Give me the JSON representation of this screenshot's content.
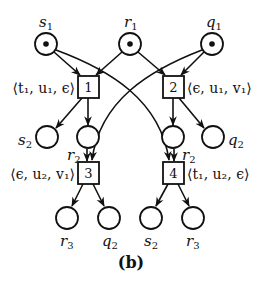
{
  "figure": {
    "caption": "(b)",
    "colors": {
      "stroke": "#111111",
      "background": "#ffffff",
      "token": "#111111"
    }
  },
  "places": [
    {
      "id": "s1",
      "label": "s",
      "sub": "1",
      "x": 46,
      "y": 44,
      "token": true,
      "label_pos": "above"
    },
    {
      "id": "r1",
      "label": "r",
      "sub": "1",
      "x": 130,
      "y": 44,
      "token": true,
      "label_pos": "above"
    },
    {
      "id": "q1",
      "label": "q",
      "sub": "1",
      "x": 212,
      "y": 44,
      "token": true,
      "label_pos": "above"
    },
    {
      "id": "s2a",
      "label": "s",
      "sub": "2",
      "x": 47,
      "y": 137,
      "token": false,
      "label_pos": "left"
    },
    {
      "id": "r2a",
      "label": "r",
      "sub": "2",
      "x": 88,
      "y": 137,
      "token": false,
      "label_pos": "below-left"
    },
    {
      "id": "r2b",
      "label": "r",
      "sub": "2",
      "x": 173,
      "y": 137,
      "token": false,
      "label_pos": "below-right"
    },
    {
      "id": "q2a",
      "label": "q",
      "sub": "2",
      "x": 213,
      "y": 137,
      "token": false,
      "label_pos": "right"
    },
    {
      "id": "r3a",
      "label": "r",
      "sub": "3",
      "x": 67,
      "y": 218,
      "token": false,
      "label_pos": "below"
    },
    {
      "id": "q2b",
      "label": "q",
      "sub": "2",
      "x": 109,
      "y": 218,
      "token": false,
      "label_pos": "below"
    },
    {
      "id": "s2b",
      "label": "s",
      "sub": "2",
      "x": 151,
      "y": 218,
      "token": false,
      "label_pos": "below"
    },
    {
      "id": "r3b",
      "label": "r",
      "sub": "3",
      "x": 193,
      "y": 218,
      "token": false,
      "label_pos": "below"
    }
  ],
  "transitions": [
    {
      "id": "t1",
      "number": "1",
      "x": 88,
      "y": 87,
      "label": "⟨t₁, u₁, ϵ⟩",
      "label_side": "left"
    },
    {
      "id": "t2",
      "number": "2",
      "x": 173,
      "y": 87,
      "label": "⟨ϵ, u₁, v₁⟩",
      "label_side": "right"
    },
    {
      "id": "t3",
      "number": "3",
      "x": 88,
      "y": 173,
      "label": "⟨ϵ, u₂, v₁⟩",
      "label_side": "left"
    },
    {
      "id": "t4",
      "number": "4",
      "x": 173,
      "y": 173,
      "label": "⟨t₁, u₂, ϵ⟩",
      "label_side": "right"
    }
  ],
  "arcs": [
    {
      "from": "s1",
      "to": "t1"
    },
    {
      "from": "r1",
      "to": "t1"
    },
    {
      "from": "r1",
      "to": "t2"
    },
    {
      "from": "q1",
      "to": "t2"
    },
    {
      "from": "t1",
      "to": "s2a"
    },
    {
      "from": "t1",
      "to": "r2a"
    },
    {
      "from": "t2",
      "to": "r2b"
    },
    {
      "from": "t2",
      "to": "q2a"
    },
    {
      "from": "r2a",
      "to": "t3"
    },
    {
      "from": "q1",
      "to": "t3",
      "curved": true
    },
    {
      "from": "r2b",
      "to": "t4"
    },
    {
      "from": "s1",
      "to": "t4",
      "curved": true
    },
    {
      "from": "t3",
      "to": "r3a"
    },
    {
      "from": "t3",
      "to": "q2b"
    },
    {
      "from": "t4",
      "to": "s2b"
    },
    {
      "from": "t4",
      "to": "r3b"
    }
  ]
}
